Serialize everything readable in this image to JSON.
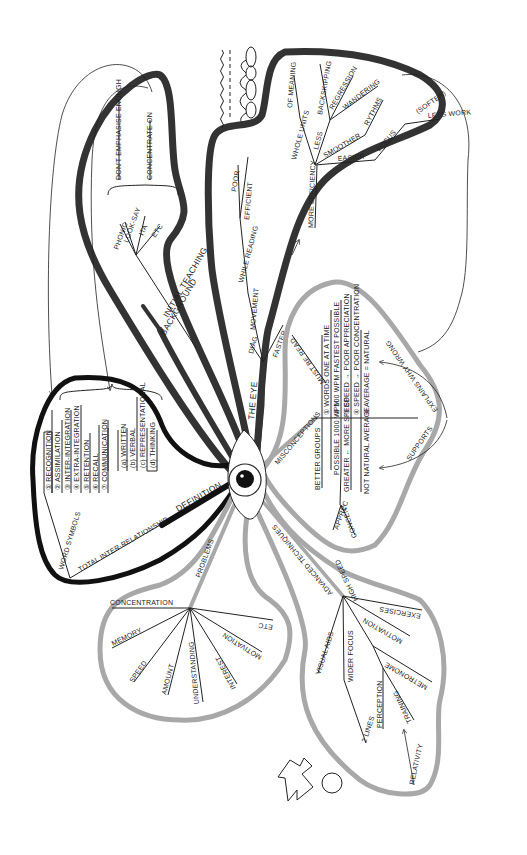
{
  "center": {
    "icon": "eye"
  },
  "colors": {
    "dark_branch": "#333333",
    "grey_branch": "#a8a8a8",
    "black_branch": "#111111"
  },
  "branches": {
    "background": {
      "label": "BACKGROUND",
      "sub": {
        "initial_teaching": "INITIAL TEACHING",
        "items": [
          "PHONIC",
          "LOOK-SAY",
          "ITA",
          "ETC"
        ],
        "notes": [
          "DON'T EMPHASISE ENOUGH",
          "CONCENTRATE ON"
        ]
      }
    },
    "the_eye": {
      "label": "THE EYE",
      "faster": "FASTER",
      "diag": "DIAG",
      "movement": "MOVEMENT",
      "while_reading": "WHILE READING",
      "efficient": "EFFICIENT",
      "poor": "POOR",
      "more_efficiency": "MORE EFFICIENCY",
      "whole_units": "WHOLE UNITS",
      "of_meaning": "OF MEANING",
      "less": "LESS",
      "backskipping": "BACKSKIPPING",
      "regression": "REGRESSION",
      "wandering": "WANDERING",
      "smoother": "SMOOTHER",
      "rythms": "RYTHMS",
      "easier": "EASIER",
      "focus": "FOCUS",
      "softer": "(SOFTER)",
      "less_work": "LESS WORK"
    },
    "definition": {
      "label": "DEFINITION",
      "total": "TOTAL INTER-RELATIONSHIP",
      "word_symbols": "WORD SYMBOLS",
      "items": [
        "① RECOGNITION",
        "② ASSIMILATION",
        "③ INTER-INTEGRATION",
        "④ EXTRA-INTEGRATION",
        "⑤ RETENTION",
        "⑥ RECALL",
        "⑦ COMMUNICATION"
      ],
      "communication_items": [
        "(a) WRITTEN",
        "(b) VERBAL",
        "(c) REPRESENTATIONAL",
        "(d) THINKING"
      ]
    },
    "misconceptions": {
      "label": "MISCONCEPTIONS",
      "must_be_read": "MUST BE READ",
      "items_right": [
        "① WORDS  ONE AT A TIME",
        "② 500 WPM  FASTEST POSSIBLE",
        "③ SPEED → POOR APPRECIATION",
        "④ SPEED → POOR CONCENTRATION",
        "⑤ AVERAGE = NATURAL"
      ],
      "items_left": [
        "BETTER  GROUPS",
        "POSSIBLE  1000 WPM",
        "GREATER ← MORE SPEED",
        "NOT NATURAL  AVERAGE"
      ],
      "apprec": "APPREC",
      "concent": "CONCENT",
      "explains_why": "EXPLAINS WHY WRONG",
      "supports": "SUPPORTS"
    },
    "problems": {
      "label": "PROBLEMS",
      "items": [
        "CONCENTRATION",
        "MEMORY",
        "SPEED",
        "AMOUNT",
        "UNDERSTANDING",
        "INTEREST",
        "MOTIVATION",
        "ETC"
      ]
    },
    "advanced_techniques": {
      "label": "ADVANCED TECHNIQUES",
      "items": [
        "VISUAL AIDS",
        "WIDER FOCUS",
        "HIGH SPEED",
        "MOTIVATION",
        "EXERCISES"
      ],
      "wider_focus_sub": "2 LINES",
      "high_speed_sub": [
        "PERCEPTION",
        "TRAINING",
        "METRONOME"
      ],
      "relativity": "RELATIVITY"
    }
  }
}
